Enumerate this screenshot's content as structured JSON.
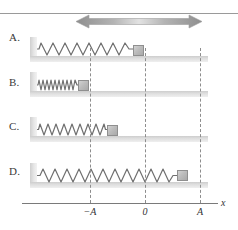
{
  "figure": {
    "background_color": "#ffffff",
    "frame_line_color": "#9a9a9a"
  },
  "arrow": {
    "name": "double-headed-motion-arrow",
    "direction": "horizontal-bidirectional",
    "color": "#a0a0a0",
    "left_x": 76,
    "right_x": 200,
    "y": 21
  },
  "axis": {
    "name": "x-axis",
    "label": "x",
    "color": "#7a7a7a",
    "ticks": [
      {
        "label": "−A",
        "x": 90,
        "value": -1
      },
      {
        "label": "0",
        "x": 145,
        "value": 0
      },
      {
        "label": "A",
        "x": 200,
        "value": 1
      }
    ]
  },
  "reference_lines": [
    {
      "name": "dashed-line-minus-a",
      "x": 90,
      "color": "#8d8d8d"
    },
    {
      "name": "dashed-line-zero",
      "x": 145,
      "color": "#8d8d8d"
    },
    {
      "name": "dashed-line-plus-a",
      "x": 200,
      "color": "#8d8d8d"
    }
  ],
  "panels": [
    {
      "label": "A.",
      "name": "panel-a",
      "label_y": 31,
      "floor_y": 56,
      "wall_y": 37,
      "spring": {
        "x": 37,
        "y": 42,
        "width": 96,
        "height": 14,
        "coils": 12,
        "state": "natural-length"
      },
      "block": {
        "x": 133,
        "y": 45,
        "position_label": "0",
        "position_value": 0
      }
    },
    {
      "label": "B.",
      "name": "panel-b",
      "label_y": 76,
      "floor_y": 91,
      "wall_y": 72,
      "spring": {
        "x": 37,
        "y": 79,
        "width": 41,
        "height": 12,
        "coils": 13,
        "state": "fully-compressed"
      },
      "block": {
        "x": 78,
        "y": 80,
        "position_label": "−A",
        "position_value": -1
      }
    },
    {
      "label": "C.",
      "name": "panel-c",
      "label_y": 120,
      "floor_y": 136,
      "wall_y": 117,
      "spring": {
        "x": 37,
        "y": 123,
        "width": 70,
        "height": 13,
        "coils": 12,
        "state": "compressed"
      },
      "block": {
        "x": 107,
        "y": 125,
        "position_label": "between −A and 0",
        "position_value": -0.7
      }
    },
    {
      "label": "D.",
      "name": "panel-d",
      "label_y": 165,
      "floor_y": 182,
      "wall_y": 163,
      "spring": {
        "x": 37,
        "y": 168,
        "width": 140,
        "height": 15,
        "coils": 12,
        "state": "stretched"
      },
      "block": {
        "x": 177,
        "y": 170,
        "position_label": "between 0 and A",
        "position_value": 0.6
      }
    }
  ]
}
